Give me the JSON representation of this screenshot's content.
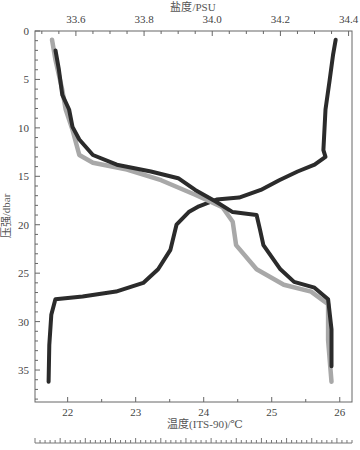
{
  "chart_data": {
    "type": "line",
    "title": "",
    "xlabel_bottom": "温度(ITS-90)/℃",
    "xlabel_top": "盐度/PSU",
    "ylabel": "压强/dbar",
    "y_axis": {
      "range": [
        0,
        38.3
      ],
      "inverted": true,
      "ticks": [
        0,
        5,
        10,
        15,
        20,
        25,
        30,
        35
      ]
    },
    "x_bottom_axis": {
      "range": [
        21.52,
        26.18
      ],
      "ticks": [
        22,
        23,
        24,
        25,
        26
      ]
    },
    "x_top_axis": {
      "range": [
        33.48,
        34.41
      ],
      "ticks": [
        33.6,
        33.8,
        34.0,
        34.2,
        34.4
      ]
    },
    "grid": false,
    "legend": null,
    "series": [
      {
        "name": "温度",
        "axis": "bottom",
        "color": "#2b2b2b",
        "width": 4,
        "points": [
          [
            25.94,
            0.9
          ],
          [
            25.9,
            2.5
          ],
          [
            25.85,
            5.1
          ],
          [
            25.79,
            8.1
          ],
          [
            25.76,
            12.3
          ],
          [
            25.79,
            13.0
          ],
          [
            25.63,
            13.8
          ],
          [
            25.38,
            14.5
          ],
          [
            25.11,
            15.4
          ],
          [
            24.84,
            16.4
          ],
          [
            24.52,
            17.2
          ],
          [
            24.19,
            17.4
          ],
          [
            23.93,
            18.1
          ],
          [
            23.78,
            18.7
          ],
          [
            23.6,
            20.0
          ],
          [
            23.51,
            22.6
          ],
          [
            23.33,
            24.6
          ],
          [
            23.11,
            26.0
          ],
          [
            22.71,
            26.9
          ],
          [
            22.22,
            27.4
          ],
          [
            21.82,
            27.7
          ],
          [
            21.76,
            29.3
          ],
          [
            21.73,
            32.4
          ],
          [
            21.72,
            36.2
          ]
        ]
      },
      {
        "name": "盐度(灰)",
        "axis": "top",
        "color": "#a8a8a8",
        "width": 4.5,
        "points": [
          [
            33.53,
            0.9
          ],
          [
            33.54,
            3.0
          ],
          [
            33.56,
            6.1
          ],
          [
            33.57,
            8.1
          ],
          [
            33.59,
            10.2
          ],
          [
            33.61,
            12.8
          ],
          [
            33.65,
            13.6
          ],
          [
            33.75,
            14.3
          ],
          [
            33.85,
            15.4
          ],
          [
            33.95,
            16.9
          ],
          [
            34.03,
            18.2
          ],
          [
            34.06,
            19.7
          ],
          [
            34.07,
            22.1
          ],
          [
            34.13,
            24.6
          ],
          [
            34.21,
            26.2
          ],
          [
            34.29,
            26.9
          ],
          [
            34.34,
            28.2
          ],
          [
            34.34,
            31.9
          ],
          [
            34.35,
            36.2
          ]
        ]
      },
      {
        "name": "盐度",
        "axis": "top",
        "color": "#2b2b2b",
        "width": 4,
        "points": [
          [
            33.54,
            2.0
          ],
          [
            33.55,
            4.0
          ],
          [
            33.56,
            6.6
          ],
          [
            33.58,
            8.1
          ],
          [
            33.59,
            9.9
          ],
          [
            33.61,
            11.2
          ],
          [
            33.65,
            12.8
          ],
          [
            33.72,
            13.8
          ],
          [
            33.82,
            14.5
          ],
          [
            33.9,
            15.2
          ],
          [
            33.95,
            16.4
          ],
          [
            34.01,
            17.6
          ],
          [
            34.06,
            18.7
          ],
          [
            34.13,
            19.0
          ],
          [
            34.14,
            20.5
          ],
          [
            34.15,
            22.1
          ],
          [
            34.2,
            24.6
          ],
          [
            34.24,
            25.9
          ],
          [
            34.3,
            26.5
          ],
          [
            34.34,
            27.7
          ],
          [
            34.35,
            30.8
          ],
          [
            34.35,
            34.6
          ]
        ]
      }
    ]
  },
  "labels": {
    "top_axis_title": "盐度/PSU",
    "bottom_axis_title": "温度(ITS-90)/℃",
    "y_axis_title": "压强/dbar"
  }
}
